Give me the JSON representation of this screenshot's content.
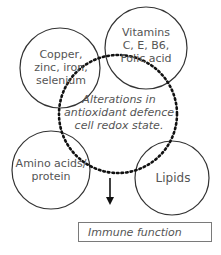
{
  "diagram": {
    "nodes": [
      {
        "id": "minerals",
        "lines": [
          "Copper,",
          "zinc, iron,",
          "selenium"
        ]
      },
      {
        "id": "vitamins",
        "lines": [
          "Vitamins",
          "C, E, B6,",
          "Folic acid"
        ]
      },
      {
        "id": "central",
        "lines": [
          "Alterations in",
          "antioxidant defence",
          "cell redox state."
        ]
      },
      {
        "id": "amino",
        "lines": [
          "Amino acids/",
          "protein"
        ]
      },
      {
        "id": "lipids",
        "lines": [
          "Lipids"
        ]
      }
    ],
    "outcome": {
      "label": "Immune function"
    },
    "edges": [
      {
        "from": "central",
        "to": "outcome",
        "type": "arrow"
      }
    ],
    "colors": {
      "stroke": "#333333",
      "text": "#555555",
      "box_border": "#7a7a7a"
    }
  }
}
